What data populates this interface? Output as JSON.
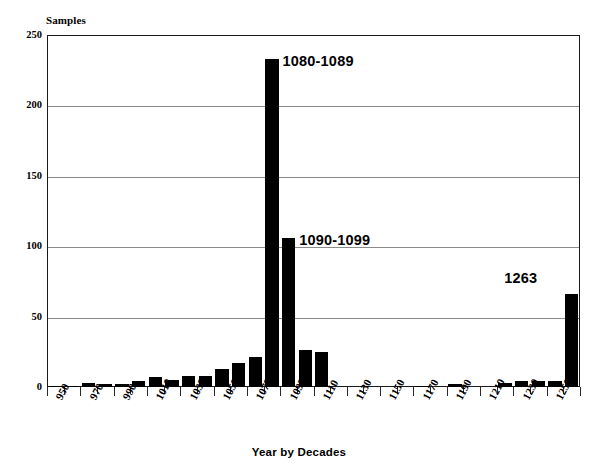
{
  "chart_data": {
    "type": "bar",
    "title": "",
    "xlabel": "Year by Decades",
    "ylabel": "Samples",
    "ylim": [
      0,
      250
    ],
    "yticks": [
      0,
      50,
      100,
      150,
      200,
      250
    ],
    "grid": true,
    "legend": null,
    "xlabel_rotation": -62,
    "xtick_labels": [
      "950",
      "970",
      "990",
      "1010",
      "1030",
      "1050",
      "1070",
      "1090",
      "1110",
      "1130",
      "1150",
      "1170",
      "1190",
      "1210",
      "1230",
      "1250"
    ],
    "categories": [
      "950",
      "960",
      "970",
      "980",
      "990",
      "1000",
      "1010",
      "1020",
      "1030",
      "1040",
      "1050",
      "1060",
      "1070",
      "1080",
      "1090",
      "1100",
      "1110",
      "1120",
      "1130",
      "1140",
      "1150",
      "1160",
      "1170",
      "1180",
      "1190",
      "1200",
      "1210",
      "1220",
      "1230",
      "1240",
      "1250",
      "1260"
    ],
    "values": [
      1,
      1,
      3,
      2,
      2,
      4,
      7,
      5,
      8,
      8,
      13,
      17,
      21,
      233,
      106,
      26,
      25,
      0,
      0,
      0,
      0,
      0,
      1,
      0,
      2,
      0,
      0,
      3,
      4,
      4,
      4,
      66
    ],
    "annotations": [
      {
        "text": "1080-1089",
        "category": "1080",
        "value": 233
      },
      {
        "text": "1090-1099",
        "category": "1090",
        "value": 106
      },
      {
        "text": "1263",
        "category": "1260",
        "value": 66
      }
    ]
  },
  "axes": {
    "y_title": "Samples",
    "x_title": "Year by Decades"
  }
}
